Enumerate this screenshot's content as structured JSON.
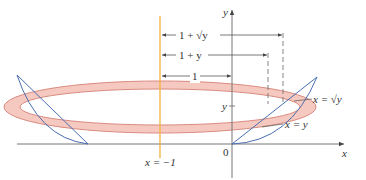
{
  "figure": {
    "axis_labels": {
      "x": "x",
      "y": "y"
    },
    "origin_label": "0",
    "vertical_line_label": "x = −1",
    "radius_labels": {
      "outer": "1 + √y",
      "inner": "1 + y",
      "axis_distance": "1"
    },
    "y_tick_label": "y",
    "curve_labels": {
      "sqrt_curve": "x = √y",
      "line": "x = y"
    },
    "colors": {
      "axis": "#666666",
      "rotation_axis": "#f2b33d",
      "washer_fill": "#f6c9c0",
      "washer_stroke": "#d98a80",
      "region_curves": "#4a6fb0",
      "dashes": "#666666"
    }
  }
}
